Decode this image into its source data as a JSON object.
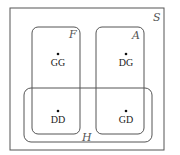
{
  "diagram": {
    "type": "venn",
    "sample_space": {
      "label": "S",
      "x": 10,
      "y": 8,
      "w": 154,
      "h": 142
    },
    "sets": [
      {
        "id": "F",
        "label": "F",
        "x": 32,
        "y": 27,
        "w": 48,
        "h": 107,
        "label_x": 72,
        "label_y": 38
      },
      {
        "id": "A",
        "label": "A",
        "x": 96,
        "y": 27,
        "w": 48,
        "h": 107,
        "label_x": 135,
        "label_y": 38
      },
      {
        "id": "H",
        "label": "H",
        "x": 24,
        "y": 88,
        "w": 128,
        "h": 54,
        "label_x": 84,
        "label_y": 139
      }
    ],
    "outcomes": [
      {
        "label": "GG",
        "x": 58,
        "y": 54
      },
      {
        "label": "DG",
        "x": 126,
        "y": 54
      },
      {
        "label": "DD",
        "x": 58,
        "y": 111
      },
      {
        "label": "GD",
        "x": 126,
        "y": 111
      }
    ],
    "colors": {
      "stroke": "#555555",
      "dot": "#111111"
    }
  }
}
